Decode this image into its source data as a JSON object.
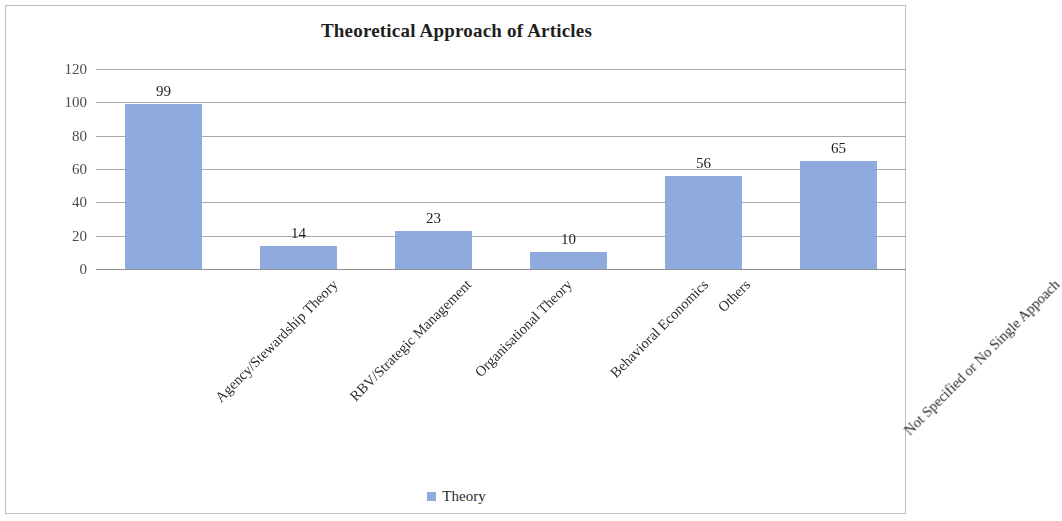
{
  "frame": {
    "border_color": "#bfbfbf",
    "background": "#ffffff"
  },
  "legend": {
    "position": "bottom-center",
    "swatch_color": "#8FAADC",
    "label": "Theory"
  },
  "chart_data": {
    "type": "bar",
    "title": "Theoretical Approach of Articles",
    "xlabel": "",
    "ylabel": "",
    "categories": [
      "Agency/Stewardship Theory",
      "RBV/Strategic Management",
      "Organisational Theory",
      "Behavioral Economics",
      "Others",
      "Not Specified or No Single Appoach"
    ],
    "values": [
      99,
      14,
      23,
      10,
      56,
      65
    ],
    "series": [
      {
        "name": "Theory",
        "color": "#8FAADC",
        "values": [
          99,
          14,
          23,
          10,
          56,
          65
        ]
      }
    ],
    "ylim": [
      0,
      120
    ],
    "yticks": [
      0,
      20,
      40,
      60,
      80,
      100,
      120
    ],
    "ytick_labels": [
      "0",
      "20",
      "40",
      "60",
      "80",
      "100",
      "120"
    ],
    "data_labels": [
      "99",
      "14",
      "23",
      "10",
      "56",
      "65"
    ],
    "grid": true,
    "grid_axis": "y",
    "legend_position": "bottom",
    "bar_color": "#8FAADC",
    "category_label_rotation": -45
  }
}
